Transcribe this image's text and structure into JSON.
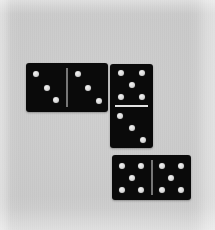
{
  "scene": {
    "width": 215,
    "height": 230,
    "background_color": "#c9c9c9",
    "domino_color": "#0a0a0a",
    "pip_color": "#e6e6e6",
    "divider_color": "#e2e2e2",
    "subject": "three dominoes on a grey surface",
    "domino_count": 3,
    "total_pips": 27
  },
  "dominoes": [
    {
      "name": "left-horizontal-domino",
      "orientation": "horizontal",
      "value_label": "3 | 3",
      "total": 6,
      "rect": {
        "x": 26,
        "y": 63,
        "w": 82,
        "h": 49
      },
      "halves": [
        {
          "name": "left-half",
          "count": 3,
          "pattern": "diagonal-descending",
          "pips": [
            {
              "x": 24,
              "y": 22
            },
            {
              "x": 50,
              "y": 50
            },
            {
              "x": 74,
              "y": 76
            }
          ]
        },
        {
          "name": "right-half",
          "count": 3,
          "pattern": "diagonal-descending",
          "pips": [
            {
              "x": 26,
              "y": 22
            },
            {
              "x": 52,
              "y": 50
            },
            {
              "x": 78,
              "y": 78
            }
          ]
        }
      ]
    },
    {
      "name": "middle-vertical-domino",
      "orientation": "vertical",
      "value_label": "5 | 3",
      "total": 8,
      "rect": {
        "x": 110,
        "y": 64,
        "w": 43,
        "h": 84
      },
      "halves": [
        {
          "name": "top-half",
          "count": 5,
          "pattern": "quincunx",
          "pips": [
            {
              "x": 26,
              "y": 22
            },
            {
              "x": 74,
              "y": 22
            },
            {
              "x": 50,
              "y": 50
            },
            {
              "x": 26,
              "y": 78
            },
            {
              "x": 74,
              "y": 78
            }
          ]
        },
        {
          "name": "bottom-half",
          "count": 3,
          "pattern": "diagonal-descending",
          "pips": [
            {
              "x": 24,
              "y": 24
            },
            {
              "x": 50,
              "y": 52
            },
            {
              "x": 76,
              "y": 80
            }
          ]
        }
      ]
    },
    {
      "name": "bottom-horizontal-domino",
      "orientation": "horizontal",
      "value_label": "5 | 5",
      "total": 10,
      "rect": {
        "x": 112,
        "y": 155,
        "w": 79,
        "h": 45
      },
      "halves": [
        {
          "name": "left-half",
          "count": 5,
          "pattern": "quincunx",
          "pips": [
            {
              "x": 26,
              "y": 24
            },
            {
              "x": 74,
              "y": 24
            },
            {
              "x": 50,
              "y": 50
            },
            {
              "x": 26,
              "y": 78
            },
            {
              "x": 74,
              "y": 78
            }
          ]
        },
        {
          "name": "right-half",
          "count": 5,
          "pattern": "quincunx",
          "pips": [
            {
              "x": 26,
              "y": 24
            },
            {
              "x": 74,
              "y": 24
            },
            {
              "x": 50,
              "y": 50
            },
            {
              "x": 26,
              "y": 78
            },
            {
              "x": 74,
              "y": 78
            }
          ]
        }
      ]
    }
  ]
}
